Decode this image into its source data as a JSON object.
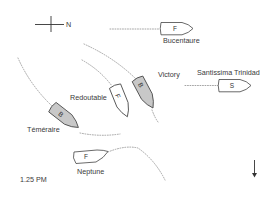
{
  "diagram": {
    "time_label": "1.25 PM",
    "compass": {
      "label": "N",
      "icon": "compass-cross-icon"
    },
    "wind_arrow": {
      "icon": "arrow-down-icon",
      "direction": "south"
    },
    "legend_letters": {
      "F": "French",
      "S": "Spanish",
      "B": "British"
    },
    "colors": {
      "british_hull": "#c8c8c8",
      "allied_hull": "#ffffff",
      "outline": "#444444",
      "track": "#9a9a9a"
    },
    "ships": [
      {
        "name": "Bucentaure",
        "letter": "F",
        "nation": "French"
      },
      {
        "name": "Santissima Trinidad",
        "letter": "S",
        "nation": "Spanish"
      },
      {
        "name": "Victory",
        "letter": "B",
        "nation": "British"
      },
      {
        "name": "Redoutable",
        "letter": "F",
        "nation": "French"
      },
      {
        "name": "Téméraire",
        "letter": "B",
        "nation": "British"
      },
      {
        "name": "Neptune",
        "letter": "F",
        "nation": "French"
      }
    ]
  }
}
